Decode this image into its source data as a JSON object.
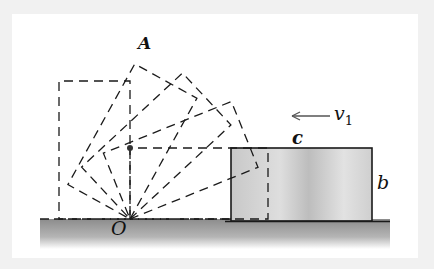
{
  "figure": {
    "labels": {
      "corner": "A",
      "pivot": "O",
      "velocity": "v",
      "velocity_subscript": "1",
      "width": "c",
      "height": "b"
    },
    "geometry": {
      "pivot": [
        130,
        219
      ],
      "block_width_c": 138,
      "block_height_b": 71,
      "rotation_angles_deg": [
        0,
        22,
        43,
        61,
        90
      ],
      "solid_block": {
        "x": 231,
        "y": 148,
        "w": 141,
        "h": 74
      }
    },
    "colors": {
      "background": "#f1f1f1",
      "panel": "#ffffff",
      "line": "#1a1a1a",
      "block_fill": "#d0d0d0",
      "ground": "#9a9a9a"
    }
  }
}
